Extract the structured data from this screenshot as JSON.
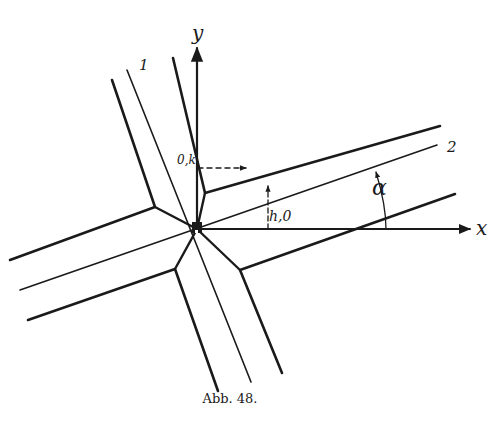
{
  "figure": {
    "caption": "Abb. 48.",
    "axes": {
      "x_label": "x",
      "y_label": "y"
    },
    "strip_labels": {
      "strip1": "1",
      "strip2": "2"
    },
    "annotations": {
      "ok": "0,k",
      "h0": "h,0",
      "alpha": "α"
    },
    "colors": {
      "ink": "#1a1a1a",
      "paper": "#ffffff"
    }
  }
}
